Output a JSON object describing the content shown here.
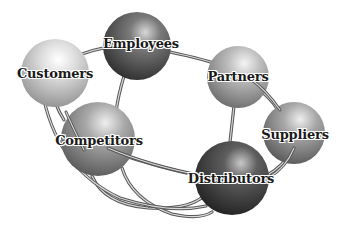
{
  "diagram": {
    "type": "network",
    "nodes": [
      {
        "id": "customers",
        "label": "Customers",
        "cx": 55,
        "cy": 73,
        "r": 34,
        "shade": "#d4d4d4"
      },
      {
        "id": "employees",
        "label": "Employees",
        "cx": 137,
        "cy": 46,
        "r": 34,
        "shade": "#6a6a6a"
      },
      {
        "id": "partners",
        "label": "Partners",
        "cx": 238,
        "cy": 77,
        "r": 31,
        "shade": "#b0b0b0"
      },
      {
        "id": "competitors",
        "label": "Competitors",
        "cx": 98,
        "cy": 139,
        "r": 37,
        "shade": "#9a9a9a"
      },
      {
        "id": "suppliers",
        "label": "Suppliers",
        "cx": 294,
        "cy": 133,
        "r": 31,
        "shade": "#8c8c8c"
      },
      {
        "id": "distributors",
        "label": "Distributors",
        "cx": 232,
        "cy": 178,
        "r": 37,
        "shade": "#505050"
      }
    ],
    "edges": [
      [
        "customers",
        "employees"
      ],
      [
        "employees",
        "partners"
      ],
      [
        "employees",
        "competitors"
      ],
      [
        "customers",
        "competitors"
      ],
      [
        "partners",
        "suppliers"
      ],
      [
        "partners",
        "distributors"
      ],
      [
        "suppliers",
        "distributors"
      ],
      [
        "competitors",
        "distributors"
      ],
      [
        "customers",
        "distributors"
      ]
    ]
  }
}
